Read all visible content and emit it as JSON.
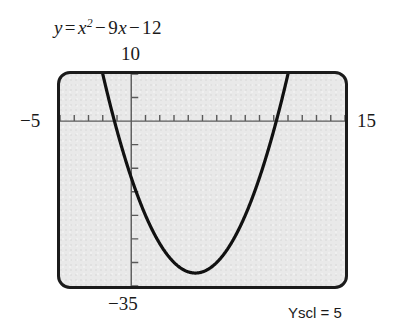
{
  "figure": {
    "equation": {
      "lhs": "y",
      "equals": "=",
      "term1_base": "x",
      "term1_exp": "2",
      "op1": "−",
      "term2": "9",
      "term2_var": "x",
      "op2": "−",
      "term3": "12",
      "plain": "y = x² − 9x − 12"
    },
    "labels": {
      "ymax": "10",
      "ymin": "−35",
      "xmin": "−5",
      "xmax": "15"
    },
    "yscl_note": "Yscl = 5",
    "colors": {
      "screen_fill": "#e9e9e9",
      "frame": "#1b1b1b",
      "curve": "#111111",
      "axis": "#5a5a5a",
      "text": "#1a1a1a",
      "page": "#ffffff"
    }
  },
  "chart_data": {
    "type": "line",
    "subtitle": "Graphing-calculator viewing window",
    "xlabel": "x",
    "ylabel": "y",
    "xlim": [
      -5,
      15
    ],
    "ylim": [
      -35,
      10
    ],
    "xscl": 1,
    "yscl": 5,
    "grid": false,
    "legend": false,
    "annotations": [
      "Yscl = 5"
    ],
    "axis_tick_labels": {
      "x": [
        "−5",
        "15"
      ],
      "y": [
        "−35",
        "10"
      ]
    },
    "function": {
      "expression": "x^2 - 9x - 12",
      "a": 1,
      "b": -9,
      "c": -12,
      "vertex": [
        4.5,
        -32.25
      ],
      "roots": [
        -1.1507,
        10.1507
      ],
      "y_intercept": -12,
      "axis_of_symmetry": 4.5
    },
    "series": [
      {
        "name": "y = x² − 9x − 12",
        "x": [
          -2.2,
          -2.0,
          -1.5,
          -1.1507,
          -1.0,
          -0.5,
          0.0,
          0.5,
          1.0,
          1.5,
          2.0,
          2.5,
          3.0,
          3.5,
          4.0,
          4.5,
          5.0,
          5.5,
          6.0,
          6.5,
          7.0,
          7.5,
          8.0,
          8.5,
          9.0,
          9.5,
          10.0,
          10.1507,
          10.5,
          11.0,
          11.2
        ],
        "y": [
          12.64,
          10.0,
          3.75,
          0.0,
          -2.0,
          -7.25,
          -12.0,
          -16.25,
          -20.0,
          -23.25,
          -26.0,
          -28.25,
          -30.0,
          -31.25,
          -32.0,
          -32.25,
          -32.0,
          -31.25,
          -30.0,
          -28.25,
          -26.0,
          -23.25,
          -20.0,
          -16.25,
          -12.0,
          -7.25,
          -2.0,
          0.0,
          3.75,
          10.0,
          12.64
        ]
      }
    ]
  }
}
